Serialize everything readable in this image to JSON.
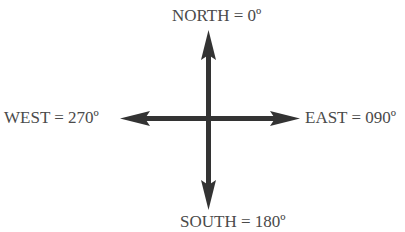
{
  "diagram": {
    "type": "compass-cardinal-directions",
    "colors": {
      "arrow": "#333333",
      "label_text": "#4a4a4a",
      "background": "#ffffff"
    },
    "labels": {
      "north": "NORTH = 0º",
      "east": "EAST = 090º",
      "south": "SOUTH = 180º",
      "west": "WEST = 270º"
    },
    "directions": [
      {
        "name": "North",
        "bearing": "0º"
      },
      {
        "name": "East",
        "bearing": "090º"
      },
      {
        "name": "South",
        "bearing": "180º"
      },
      {
        "name": "West",
        "bearing": "270º"
      }
    ]
  }
}
